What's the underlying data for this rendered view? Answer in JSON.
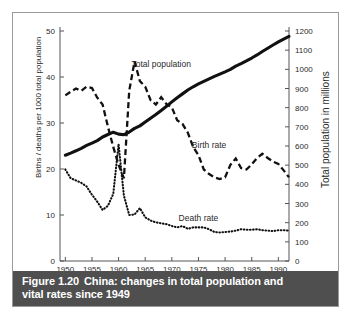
{
  "figure": {
    "caption_number": "Figure 1.20",
    "caption_line1": "China: changes in total population and",
    "caption_line2": "vital rates since 1949",
    "border_color": "#9a9a9a",
    "caption_bg_color": "#4f4f4f",
    "caption_text_color": "#ffffff"
  },
  "chart_data": {
    "type": "line",
    "title": "China: changes in total population and vital rates since 1949",
    "xlabel": "",
    "ylabel": "Births / deaths per 1000 total population",
    "ylabel_right": "Total population in millions",
    "xlim": [
      1949,
      1992
    ],
    "ylim": [
      0,
      50
    ],
    "ylim_right": [
      0,
      1200
    ],
    "grid": false,
    "legend_position": "inline-annotations",
    "xticks": [
      1950,
      1955,
      1960,
      1965,
      1970,
      1975,
      1980,
      1985,
      1990
    ],
    "xtick_labels": [
      "1950",
      "1955",
      "1960",
      "1965",
      "1970",
      "1975",
      "1980",
      "1985",
      "1990"
    ],
    "yticks": [
      0,
      10,
      20,
      30,
      40,
      50
    ],
    "ytick_labels": [
      "0",
      "10",
      "20",
      "30",
      "40",
      "50"
    ],
    "yticks_right": [
      0,
      100,
      200,
      300,
      400,
      500,
      600,
      700,
      800,
      900,
      1000,
      1100,
      1200
    ],
    "ytick_labels_right": [
      "0",
      "100",
      "200",
      "300",
      "400",
      "500",
      "600",
      "700",
      "800",
      "900",
      "1000",
      "1100",
      "1200"
    ],
    "x": [
      1950,
      1951,
      1952,
      1953,
      1954,
      1955,
      1956,
      1957,
      1958,
      1959,
      1960,
      1961,
      1962,
      1963,
      1964,
      1965,
      1966,
      1967,
      1968,
      1969,
      1970,
      1971,
      1972,
      1973,
      1974,
      1975,
      1976,
      1977,
      1978,
      1979,
      1980,
      1981,
      1982,
      1983,
      1984,
      1985,
      1986,
      1987,
      1988,
      1989,
      1990,
      1991,
      1992
    ],
    "series": [
      {
        "name": "Total population",
        "axis": "right",
        "unit": "millions",
        "style": "solid",
        "label_x": 1968,
        "label_y_right": 1010,
        "values": [
          552,
          563,
          575,
          588,
          603,
          615,
          628,
          647,
          660,
          672,
          662,
          659,
          673,
          692,
          705,
          725,
          745,
          764,
          785,
          807,
          830,
          852,
          872,
          892,
          909,
          924,
          937,
          950,
          963,
          975,
          987,
          1000,
          1017,
          1030,
          1044,
          1059,
          1075,
          1093,
          1110,
          1127,
          1143,
          1158,
          1172
        ]
      },
      {
        "name": "Birth rate",
        "axis": "left",
        "unit": "per 1000",
        "style": "dashed",
        "label_x": 1977,
        "label_y_left": 24.5,
        "values": [
          36.0,
          36.8,
          37.5,
          37.0,
          37.9,
          37.6,
          35.5,
          34.0,
          29.2,
          24.8,
          20.9,
          18.0,
          37.0,
          43.4,
          39.1,
          37.9,
          35.0,
          34.0,
          35.6,
          34.1,
          33.4,
          30.6,
          29.8,
          27.9,
          24.8,
          23.0,
          19.9,
          18.9,
          18.2,
          17.8,
          18.2,
          20.9,
          22.3,
          20.2,
          19.9,
          21.0,
          22.4,
          23.3,
          22.4,
          21.6,
          21.1,
          19.7,
          18.2
        ]
      },
      {
        "name": "Death rate",
        "axis": "left",
        "unit": "per 1000",
        "style": "dotted",
        "label_x": 1975,
        "label_y_left": 8.6,
        "values": [
          19.9,
          18.0,
          17.5,
          17.0,
          16.2,
          14.4,
          12.9,
          11.1,
          12.0,
          14.6,
          25.4,
          14.2,
          10.0,
          10.1,
          11.5,
          9.5,
          8.8,
          8.4,
          8.2,
          8.0,
          7.6,
          7.3,
          7.6,
          7.0,
          7.3,
          7.3,
          7.3,
          6.9,
          6.3,
          6.2,
          6.3,
          6.4,
          6.6,
          6.9,
          6.8,
          6.8,
          6.9,
          6.7,
          6.6,
          6.5,
          6.7,
          6.7,
          6.6
        ]
      }
    ]
  }
}
